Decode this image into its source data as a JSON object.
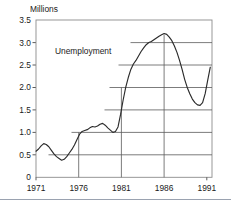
{
  "chart_data": {
    "type": "line",
    "title": "",
    "ylabel": "Millions",
    "xlabel": "",
    "ylim": [
      0,
      3.5
    ],
    "xlim": [
      1971,
      1991.6
    ],
    "grid": true,
    "legend": "none",
    "annotations": [
      {
        "text": "Unemployment",
        "x": 1975.2,
        "y": 2.62
      }
    ],
    "ytick_labels": [
      "0",
      "0.5",
      "1.0",
      "1.5",
      "2.0",
      "2.5",
      "3.0",
      "3.5"
    ],
    "ytick_values": [
      0,
      0.5,
      1.0,
      1.5,
      2.0,
      2.5,
      3.0,
      3.5
    ],
    "xtick_labels": [
      "1971",
      "1976",
      "1981",
      "1986",
      "1991"
    ],
    "xtick_values": [
      1971,
      1976,
      1981,
      1986,
      1991
    ],
    "series": [
      {
        "name": "Unemployment",
        "color": "#2b2b2b",
        "x": [
          1971.0,
          1971.3,
          1971.6,
          1971.9,
          1972.2,
          1972.5,
          1972.8,
          1973.1,
          1973.4,
          1973.7,
          1974.0,
          1974.3,
          1974.6,
          1974.9,
          1975.2,
          1975.5,
          1975.8,
          1976.1,
          1976.4,
          1976.7,
          1977.0,
          1977.3,
          1977.6,
          1977.9,
          1978.2,
          1978.5,
          1978.8,
          1979.1,
          1979.4,
          1979.7,
          1980.0,
          1980.3,
          1980.6,
          1980.9,
          1981.2,
          1981.5,
          1981.8,
          1982.1,
          1982.4,
          1982.7,
          1983.0,
          1983.3,
          1983.6,
          1983.9,
          1984.2,
          1984.5,
          1984.8,
          1985.1,
          1985.4,
          1985.7,
          1986.0,
          1986.3,
          1986.6,
          1986.9,
          1987.2,
          1987.5,
          1987.8,
          1988.1,
          1988.4,
          1988.7,
          1989.0,
          1989.3,
          1989.6,
          1989.9,
          1990.2,
          1990.5,
          1990.8,
          1991.1,
          1991.4
        ],
        "y": [
          0.58,
          0.63,
          0.7,
          0.75,
          0.73,
          0.68,
          0.6,
          0.52,
          0.46,
          0.42,
          0.38,
          0.4,
          0.46,
          0.54,
          0.62,
          0.72,
          0.84,
          0.96,
          1.02,
          1.04,
          1.06,
          1.1,
          1.13,
          1.12,
          1.14,
          1.18,
          1.2,
          1.16,
          1.1,
          1.05,
          1.0,
          1.02,
          1.12,
          1.4,
          1.72,
          2.0,
          2.22,
          2.4,
          2.52,
          2.6,
          2.7,
          2.8,
          2.88,
          2.95,
          3.0,
          3.02,
          3.06,
          3.1,
          3.14,
          3.17,
          3.2,
          3.18,
          3.12,
          3.04,
          2.92,
          2.78,
          2.6,
          2.4,
          2.18,
          2.0,
          1.86,
          1.74,
          1.66,
          1.61,
          1.6,
          1.66,
          1.86,
          2.16,
          2.45
        ]
      }
    ],
    "gridline_note": "horizontal gridlines begin at curve crossing and extend to right edge; vertical gridlines at 1976, 1981, 1986 run from curve down to axis"
  }
}
